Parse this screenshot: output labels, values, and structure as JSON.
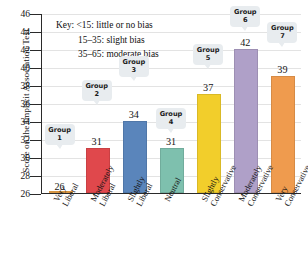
{
  "chart_data": {
    "type": "bar",
    "title": "",
    "xlabel": "",
    "ylabel": "Score on the Implicit Association Test",
    "ylim": [
      26,
      46
    ],
    "ytick_step": 2,
    "grid": true,
    "legend_position": "inside-top-left",
    "categories": [
      "Very Liberal",
      "Moderately Liberal",
      "Slightly Liberal",
      "Neutral",
      "Slightly Conservative",
      "Moderately Conservative",
      "Very Conservative"
    ],
    "values": [
      26,
      31,
      34,
      31,
      37,
      42,
      39
    ],
    "point_labels": [
      "Group 1",
      "Group 2",
      "Group 3",
      "Group 4",
      "Group 5",
      "Group 6",
      "Group 7"
    ],
    "bar_colors": [
      "#F0A84B",
      "#E0484C",
      "#5A85BB",
      "#7EC0AE",
      "#F2CE2B",
      "#AFA0C8",
      "#EF9B4E"
    ],
    "yticks": [
      26,
      28,
      30,
      32,
      34,
      36,
      38,
      40,
      42,
      44,
      46
    ],
    "annotations": {
      "key_title": "Key:",
      "key_items": [
        "<15: little or no bias",
        "15–35: slight bias",
        "35–65: moderate bias"
      ]
    }
  },
  "axis": {
    "y_title": "Score on the Implicit Association Test",
    "y_labels": [
      "46",
      "44",
      "42",
      "40",
      "38",
      "36",
      "34",
      "32",
      "30",
      "28",
      "26"
    ]
  },
  "key": {
    "label": "Key:",
    "line1": "<15: little or no bias",
    "line2": "15–35: slight bias",
    "line3": "35–65: moderate bias"
  },
  "bars": [
    {
      "group": "Group",
      "group_num": "1",
      "value": "26",
      "cat_line1": "Very",
      "cat_line2": "Liberal"
    },
    {
      "group": "Group",
      "group_num": "2",
      "value": "31",
      "cat_line1": "Moderately",
      "cat_line2": "Liberal"
    },
    {
      "group": "Group",
      "group_num": "3",
      "value": "34",
      "cat_line1": "Slightly",
      "cat_line2": "Liberal"
    },
    {
      "group": "Group",
      "group_num": "4",
      "value": "31",
      "cat_line1": "Neutral",
      "cat_line2": ""
    },
    {
      "group": "Group",
      "group_num": "5",
      "value": "37",
      "cat_line1": "Slightly",
      "cat_line2": "Conservative"
    },
    {
      "group": "Group",
      "group_num": "6",
      "value": "42",
      "cat_line1": "Moderately",
      "cat_line2": "Conservative"
    },
    {
      "group": "Group",
      "group_num": "7",
      "value": "39",
      "cat_line1": "Very",
      "cat_line2": "Conservative"
    }
  ]
}
